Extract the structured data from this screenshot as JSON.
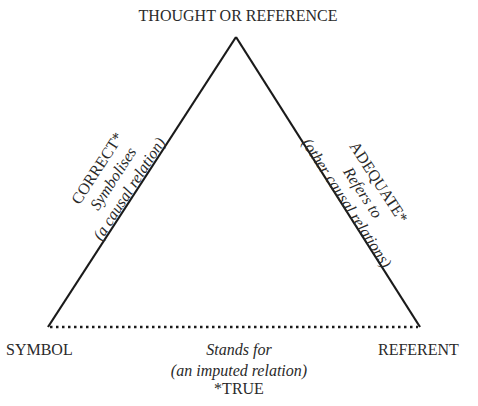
{
  "diagram": {
    "vertices": {
      "top": "THOUGHT OR REFERENCE",
      "left": "SYMBOL",
      "right": "REFERENT"
    },
    "left_edge": {
      "line1": "CORRECT*",
      "line2": "Symbolises",
      "line3": "(a causal relation)"
    },
    "right_edge": {
      "line1": "ADEQUATE*",
      "line2": "Refers to",
      "line3": "(other causal relations)"
    },
    "bottom_edge": {
      "line1": "Stands for",
      "line2": "(an imputed relation)",
      "line3": "*TRUE",
      "style": "dotted"
    },
    "colors": {
      "line": "#1a1a1a",
      "text": "#2a2a2a",
      "background": "#ffffff"
    }
  }
}
